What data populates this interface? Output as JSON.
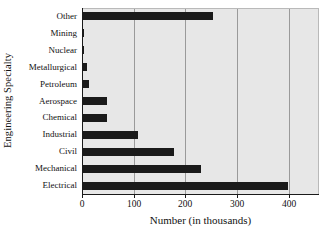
{
  "chart_data": {
    "type": "bar",
    "orientation": "horizontal",
    "title": "",
    "xlabel": "Number (in thousands)",
    "ylabel": "Engineering Specialty",
    "categories": [
      "Electrical",
      "Mechanical",
      "Civil",
      "Industrial",
      "Chemical",
      "Aerospace",
      "Petroleum",
      "Metallurgical",
      "Nuclear",
      "Mining",
      "Other"
    ],
    "values": [
      398,
      230,
      178,
      108,
      48,
      48,
      13,
      9,
      4,
      3,
      253
    ],
    "series": [
      {
        "name": "Number of engineers",
        "values": [
          398,
          230,
          178,
          108,
          48,
          48,
          13,
          9,
          4,
          3,
          253
        ]
      }
    ],
    "xlim": [
      0,
      457
    ],
    "xticks": [
      0,
      100,
      200,
      300,
      400
    ],
    "xtick_labels": [
      "0",
      "100",
      "200",
      "300",
      "400"
    ],
    "grid": "vertical",
    "legend": "none",
    "bar_color": "#1a1a1a",
    "plot_background": "#e7e7e7",
    "gridline_color": "#9a9a9a"
  },
  "axes": {
    "y_title": "Engineering Specialty",
    "x_title": "Number (in thousands)"
  }
}
